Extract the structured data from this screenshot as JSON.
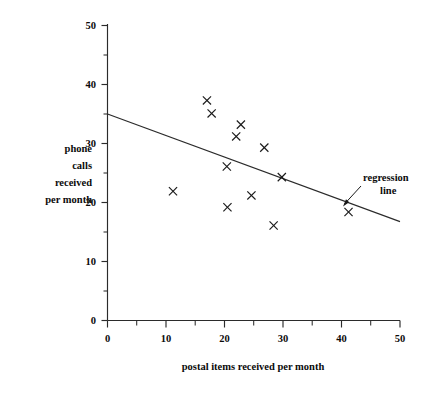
{
  "chart_data": {
    "type": "scatter",
    "title": "",
    "xlabel": "postal items received per month",
    "ylabel": "phone calls received per month",
    "ylabel_lines": [
      "phone",
      "calls",
      "received",
      "per month"
    ],
    "xlim": [
      0,
      50
    ],
    "ylim": [
      0,
      50
    ],
    "xticks": [
      0,
      10,
      20,
      30,
      40,
      50
    ],
    "yticks": [
      0,
      10,
      20,
      30,
      40,
      50
    ],
    "xtick_labels": [
      "0",
      "10",
      "20",
      "30",
      "40",
      "50"
    ],
    "ytick_labels": [
      "0",
      "10",
      "20",
      "30",
      "40",
      "50"
    ],
    "xminor_ticks": [
      5,
      15,
      25,
      35,
      45
    ],
    "yminor_ticks": [
      5,
      15,
      25,
      35,
      45
    ],
    "grid": false,
    "legend": "none",
    "marker": "x",
    "points": [
      {
        "x": 17.0,
        "y": 37.3
      },
      {
        "x": 17.8,
        "y": 35.1
      },
      {
        "x": 22.8,
        "y": 33.2
      },
      {
        "x": 22.0,
        "y": 31.2
      },
      {
        "x": 26.8,
        "y": 29.3
      },
      {
        "x": 20.4,
        "y": 26.1
      },
      {
        "x": 29.8,
        "y": 24.3
      },
      {
        "x": 11.2,
        "y": 21.9
      },
      {
        "x": 24.6,
        "y": 21.2
      },
      {
        "x": 20.5,
        "y": 19.2
      },
      {
        "x": 28.4,
        "y": 16.1
      },
      {
        "x": 41.2,
        "y": 18.4
      }
    ],
    "series": [
      {
        "name": "observations",
        "marker": "x",
        "color": "#1a1a1a",
        "x": [
          17.0,
          17.8,
          22.8,
          22.0,
          26.8,
          20.4,
          29.8,
          11.2,
          24.6,
          20.5,
          28.4,
          41.2
        ],
        "y": [
          37.3,
          35.1,
          33.2,
          31.2,
          29.3,
          26.1,
          24.3,
          21.9,
          21.2,
          19.2,
          16.1,
          18.4
        ]
      }
    ],
    "regression_line": {
      "label": "regression line",
      "label_lines": [
        "regression",
        "line"
      ],
      "x_start": 0,
      "y_start": 35.0,
      "x_end": 50,
      "y_end": 16.8,
      "slope": -0.364,
      "intercept": 35.0,
      "color": "#2b2b2b"
    },
    "annotations": [
      {
        "text": "regression line",
        "target_x": 39.5,
        "target_y": 20.6
      }
    ]
  },
  "axes": {
    "x_axis_name": "postal-items-axis",
    "y_axis_name": "phone-calls-axis"
  }
}
